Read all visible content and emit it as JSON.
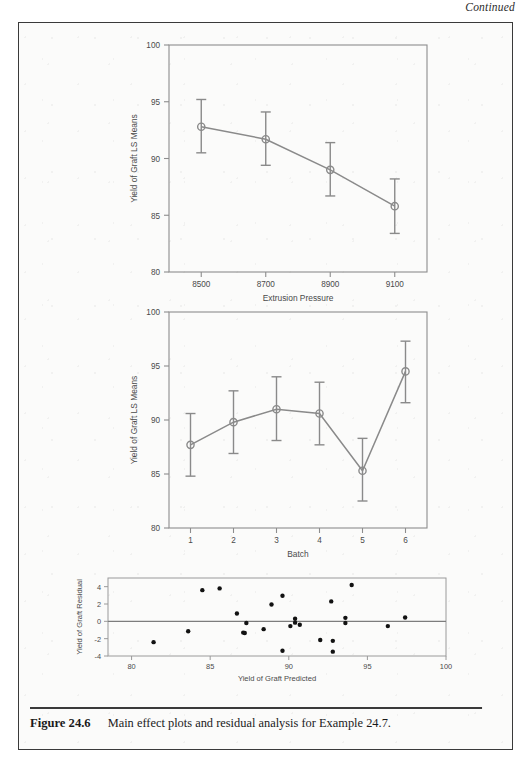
{
  "page": {
    "continued_label": "Continued",
    "caption_number": "Figure 24.6",
    "caption_text": "Main effect plots and residual analysis for Example 24.7.",
    "frame_color": "#3a3a3a",
    "background_color": "#fbfbfa"
  },
  "chart_data": [
    {
      "id": "extrusion-pressure-main-effect",
      "type": "line",
      "title": "",
      "xlabel": "Extrusion Pressure",
      "ylabel": "Yield of Graft LS Means",
      "categories": [
        "8500",
        "8700",
        "8900",
        "9100"
      ],
      "xtick_labels": [
        "8500",
        "8700",
        "8900",
        "9100"
      ],
      "ytick_labels": [
        "80",
        "85",
        "90",
        "95",
        "100"
      ],
      "ylim": [
        80,
        100
      ],
      "yticks": [
        80,
        85,
        90,
        95,
        100
      ],
      "values": [
        92.8,
        91.7,
        89.0,
        85.8
      ],
      "error_upper": [
        95.2,
        94.1,
        91.4,
        88.2
      ],
      "error_lower": [
        90.5,
        89.4,
        86.7,
        83.4
      ],
      "grid": false,
      "legend": "none",
      "marker": "open-circle",
      "line_color": "#8a8a8a",
      "marker_color": "#8a8a8a"
    },
    {
      "id": "batch-main-effect",
      "type": "line",
      "title": "",
      "xlabel": "Batch",
      "ylabel": "Yield of Graft LS Means",
      "categories": [
        "1",
        "2",
        "3",
        "4",
        "5",
        "6"
      ],
      "xtick_labels": [
        "1",
        "2",
        "3",
        "4",
        "5",
        "6"
      ],
      "ytick_labels": [
        "80",
        "85",
        "90",
        "95",
        "100"
      ],
      "ylim": [
        80,
        100
      ],
      "yticks": [
        80,
        85,
        90,
        95,
        100
      ],
      "values": [
        87.7,
        89.8,
        91.0,
        90.6,
        85.3,
        94.5
      ],
      "error_upper": [
        90.6,
        92.7,
        94.0,
        93.5,
        88.3,
        97.3
      ],
      "error_lower": [
        84.8,
        86.9,
        88.1,
        87.7,
        82.5,
        91.6
      ],
      "grid": false,
      "legend": "none",
      "marker": "open-circle",
      "line_color": "#8a8a8a",
      "marker_color": "#8a8a8a"
    },
    {
      "id": "residual-analysis",
      "type": "scatter",
      "title": "",
      "xlabel": "Yield of Graft Predicted",
      "ylabel": "Yield of Graft Residual",
      "xtick_labels": [
        "80",
        "85",
        "90",
        "95",
        "100"
      ],
      "ytick_labels": [
        "-4",
        "-2",
        "0",
        "2",
        "4"
      ],
      "xlim": [
        78.5,
        100
      ],
      "ylim": [
        -4,
        5
      ],
      "xticks": [
        80,
        85,
        90,
        95,
        100
      ],
      "yticks": [
        -4,
        -2,
        0,
        2,
        4
      ],
      "reference_line_y": 0,
      "grid": false,
      "legend": "none",
      "marker": "filled-circle",
      "marker_color": "#121212",
      "points": [
        {
          "x": 81.4,
          "y": -2.4
        },
        {
          "x": 83.6,
          "y": -1.15
        },
        {
          "x": 84.5,
          "y": 3.6
        },
        {
          "x": 85.6,
          "y": 3.8
        },
        {
          "x": 86.7,
          "y": 0.9
        },
        {
          "x": 87.1,
          "y": -1.3
        },
        {
          "x": 87.2,
          "y": -1.35
        },
        {
          "x": 87.3,
          "y": -0.2
        },
        {
          "x": 88.4,
          "y": -0.9
        },
        {
          "x": 88.9,
          "y": 1.95
        },
        {
          "x": 89.6,
          "y": 2.95
        },
        {
          "x": 89.6,
          "y": -3.4
        },
        {
          "x": 90.1,
          "y": -0.55
        },
        {
          "x": 90.4,
          "y": 0.3
        },
        {
          "x": 90.4,
          "y": -0.15
        },
        {
          "x": 90.7,
          "y": -0.4
        },
        {
          "x": 92.0,
          "y": -2.15
        },
        {
          "x": 92.7,
          "y": 2.3
        },
        {
          "x": 92.8,
          "y": -2.25
        },
        {
          "x": 92.8,
          "y": -3.5
        },
        {
          "x": 93.6,
          "y": 0.4
        },
        {
          "x": 93.6,
          "y": -0.2
        },
        {
          "x": 94.0,
          "y": 4.2
        },
        {
          "x": 96.3,
          "y": -0.55
        },
        {
          "x": 97.4,
          "y": 0.45
        }
      ]
    }
  ]
}
